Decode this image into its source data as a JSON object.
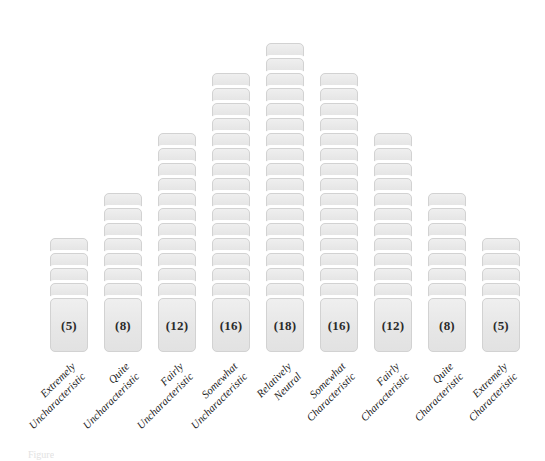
{
  "figure": {
    "caption_partial": "Figure"
  },
  "chart_data": {
    "type": "bar",
    "title": "",
    "subtitle": "",
    "xlabel": "",
    "ylabel": "",
    "grid": false,
    "legend": false,
    "ylim": [
      0,
      18
    ],
    "categories": [
      "Extremely Uncharacteristic",
      "Quite Uncharacteristic",
      "Fairly Uncharacteristic",
      "Somewhat Uncharacteristic",
      "Relatively Neutral",
      "Somewhat Characteristic",
      "Fairly Characteristic",
      "Quite Characteristic",
      "Extremely Characteristic"
    ],
    "values": [
      5,
      8,
      12,
      16,
      18,
      16,
      12,
      8,
      5
    ],
    "value_labels": [
      "(5)",
      "(8)",
      "(12)",
      "(16)",
      "(18)",
      "(16)",
      "(12)",
      "(8)",
      "(5)"
    ],
    "total": 100,
    "annotations": []
  },
  "columns": [
    {
      "index": 0,
      "count": 5,
      "label_text": "(5)",
      "line1": "Extremely",
      "line2": "Uncharacteristic",
      "left": 47
    },
    {
      "index": 1,
      "count": 8,
      "label_text": "(8)",
      "line1": "Quite",
      "line2": "Uncharacteristic",
      "left": 101
    },
    {
      "index": 2,
      "count": 12,
      "label_text": "(12)",
      "line1": "Fairly",
      "line2": "Uncharacteristic",
      "left": 155
    },
    {
      "index": 3,
      "count": 16,
      "label_text": "(16)",
      "line1": "Somewhat",
      "line2": "Uncharacteristic",
      "left": 209
    },
    {
      "index": 4,
      "count": 18,
      "label_text": "(18)",
      "line1": "Relatively",
      "line2": "Neutral",
      "left": 263
    },
    {
      "index": 5,
      "count": 16,
      "label_text": "(16)",
      "line1": "Somewhat",
      "line2": "Characteristic",
      "left": 317
    },
    {
      "index": 6,
      "count": 12,
      "label_text": "(12)",
      "line1": "Fairly",
      "line2": "Characteristic",
      "left": 371
    },
    {
      "index": 7,
      "count": 8,
      "label_text": "(8)",
      "line1": "Quite",
      "line2": "Characteristic",
      "left": 425
    },
    {
      "index": 8,
      "count": 5,
      "label_text": "(5)",
      "line1": "Extremely",
      "line2": "Characteristic",
      "left": 479
    }
  ],
  "colors": {
    "card_fill": "#e9e9e9",
    "card_inner_border": "#d2d2d2",
    "card_outer_border": "#ffffff",
    "text": "#1b1b1b",
    "background": "#ffffff"
  }
}
